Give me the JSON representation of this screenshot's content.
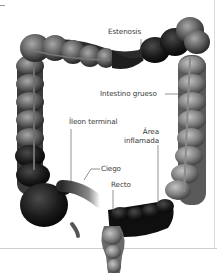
{
  "figure": {
    "labels": {
      "estenosis": "Estenosis",
      "intestino_grueso": "Intestino grueso",
      "ileon_terminal": "Íleon terminal",
      "area_line1": "Área",
      "area_line2": "inflamada",
      "ciego": "Ciego",
      "recto": "Recto"
    },
    "colors": {
      "background": "#ffffff",
      "label_text": "#3a3a3a",
      "leader_line": "#4a4a4a",
      "frame_line": "#d9d9d9"
    }
  }
}
